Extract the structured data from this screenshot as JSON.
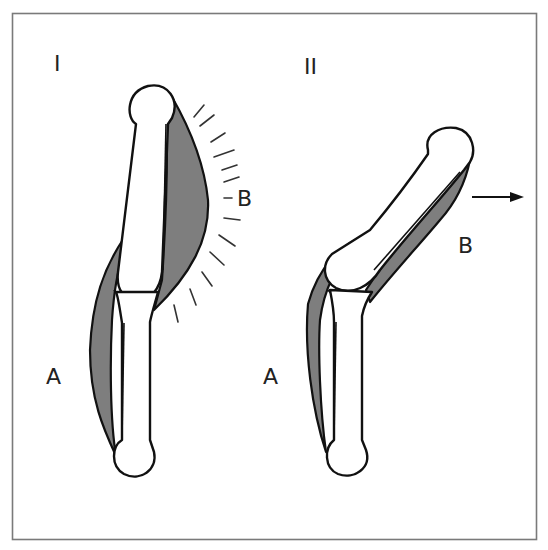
{
  "figure": {
    "panels": [
      {
        "id": "I",
        "label": "I",
        "state": "flexed",
        "muscles": [
          {
            "label": "A",
            "role": "relaxed muscle"
          },
          {
            "label": "B",
            "role": "contracted muscle"
          }
        ]
      },
      {
        "id": "II",
        "label": "II",
        "state": "extended",
        "muscles": [
          {
            "label": "A",
            "role": "muscle"
          },
          {
            "label": "B",
            "role": "muscle"
          }
        ],
        "arrow": "right"
      }
    ],
    "colors": {
      "frame": "#7a7a7a",
      "muscle_fill": "#7e7e7e",
      "outline": "#111111",
      "background": "#ffffff"
    }
  }
}
